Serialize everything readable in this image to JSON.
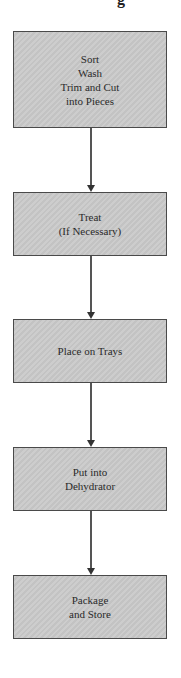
{
  "header": {
    "partial_glyph": "g"
  },
  "steps": [
    {
      "label": "Sort\nWash\nTrim and Cut\ninto Pieces"
    },
    {
      "label": "Treat\n(If Necessary)"
    },
    {
      "label": "Place on Trays"
    },
    {
      "label": "Put into\nDehydrator"
    },
    {
      "label": "Package\nand Store"
    }
  ]
}
